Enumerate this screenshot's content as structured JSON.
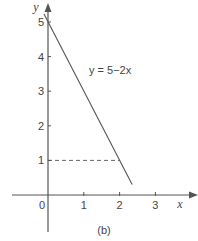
{
  "chart_data": {
    "type": "line",
    "title": "",
    "caption": "(b)",
    "xlabel": "x",
    "ylabel": "y",
    "xlim": [
      -0.3,
      3.9
    ],
    "ylim": [
      -1.1,
      5.5
    ],
    "x_ticks": [
      0,
      1,
      2,
      3
    ],
    "x_tick_labels": [
      "0",
      "1",
      "2",
      "3"
    ],
    "y_ticks": [
      1,
      2,
      3,
      4,
      5
    ],
    "y_tick_labels": [
      "1",
      "2",
      "3",
      "4",
      "5"
    ],
    "grid": false,
    "series": [
      {
        "name": "y = 5−2x",
        "equation": "y = 5−2x",
        "points": [
          [
            0,
            5
          ],
          [
            2.35,
            0.3
          ]
        ],
        "style": "solid"
      }
    ],
    "annotations": [
      {
        "type": "dashed-guide",
        "from": [
          0,
          1
        ],
        "to": [
          2,
          1
        ]
      }
    ],
    "colors": {
      "line": "#555555",
      "axis": "#555555",
      "text": "#444444"
    }
  }
}
